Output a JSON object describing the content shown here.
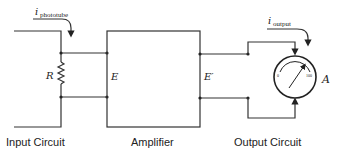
{
  "diagram": {
    "type": "circuit-block-diagram",
    "sections": {
      "input": {
        "caption": "Input Circuit",
        "current_label": "i",
        "current_subscript": "phototube",
        "resistor_label": "R"
      },
      "amplifier": {
        "caption": "Amplifier",
        "input_voltage_label": "E",
        "output_voltage_label": "E′"
      },
      "output": {
        "caption": "Output Circuit",
        "current_label": "i",
        "current_subscript": "output",
        "meter_label": "A",
        "meter_scale_min": "0",
        "meter_scale_max": "100"
      }
    },
    "colors": {
      "line": "#333333",
      "background": "#ffffff"
    }
  }
}
